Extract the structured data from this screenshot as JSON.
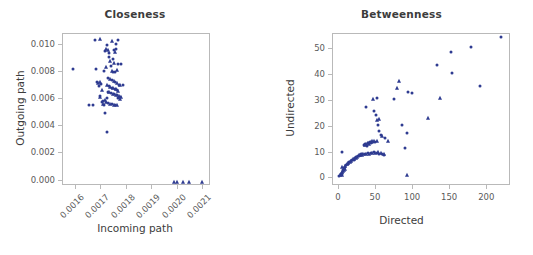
{
  "figure": {
    "background": "#ffffff",
    "marker_color": "#2e3b91",
    "axis_color": "#b9b9b9",
    "text_color": "#5a5a5a",
    "title_color": "#3c3c3c"
  },
  "chart_data": [
    {
      "type": "scatter",
      "title": "Closeness",
      "xlabel": "Incoming path",
      "ylabel": "Outgoing path",
      "xlim": [
        0.00155,
        0.00213
      ],
      "ylim": [
        -0.0004,
        0.0108
      ],
      "xticks": [
        0.0016,
        0.0017,
        0.0018,
        0.0019,
        0.002,
        0.0021
      ],
      "xticklabels": [
        "0.0016",
        "0.0017",
        "0.0018",
        "0.0019",
        "0.0020",
        "0.0021"
      ],
      "xtick_rotation": -45,
      "yticks": [
        0.0,
        0.002,
        0.004,
        0.006,
        0.008,
        0.01
      ],
      "yticklabels": [
        "0.000",
        "0.002",
        "0.004",
        "0.006",
        "0.008",
        "0.010"
      ],
      "grid": false,
      "legend": null,
      "points": [
        {
          "x": 0.001592,
          "y": 0.00818,
          "m": "dot"
        },
        {
          "x": 0.001655,
          "y": 0.00548,
          "m": "dot"
        },
        {
          "x": 0.001672,
          "y": 0.00548,
          "m": "dot"
        },
        {
          "x": 0.001679,
          "y": 0.01032,
          "m": "dot"
        },
        {
          "x": 0.0017,
          "y": 0.01035,
          "m": "tri"
        },
        {
          "x": 0.001682,
          "y": 0.00812,
          "m": "dot"
        },
        {
          "x": 0.001686,
          "y": 0.00718,
          "m": "dot"
        },
        {
          "x": 0.00169,
          "y": 0.00708,
          "m": "tri"
        },
        {
          "x": 0.001694,
          "y": 0.0069,
          "m": "dot"
        },
        {
          "x": 0.001697,
          "y": 0.00722,
          "m": "tri"
        },
        {
          "x": 0.001701,
          "y": 0.00702,
          "m": "dot"
        },
        {
          "x": 0.001705,
          "y": 0.0066,
          "m": "tri"
        },
        {
          "x": 0.001708,
          "y": 0.00568,
          "m": "dot"
        },
        {
          "x": 0.001712,
          "y": 0.00556,
          "m": "tri"
        },
        {
          "x": 0.001716,
          "y": 0.00548,
          "m": "dot"
        },
        {
          "x": 0.00172,
          "y": 0.00945,
          "m": "dot"
        },
        {
          "x": 0.001724,
          "y": 0.00965,
          "m": "tri"
        },
        {
          "x": 0.001727,
          "y": 0.00988,
          "m": "dot"
        },
        {
          "x": 0.00173,
          "y": 0.00958,
          "m": "tri"
        },
        {
          "x": 0.001733,
          "y": 0.0093,
          "m": "dot"
        },
        {
          "x": 0.001736,
          "y": 0.009,
          "m": "dot"
        },
        {
          "x": 0.001739,
          "y": 0.00875,
          "m": "tri"
        },
        {
          "x": 0.001742,
          "y": 0.00838,
          "m": "dot"
        },
        {
          "x": 0.001721,
          "y": 0.00828,
          "m": "tri"
        },
        {
          "x": 0.001745,
          "y": 0.0102,
          "m": "tri"
        },
        {
          "x": 0.00176,
          "y": 0.01,
          "m": "dot"
        },
        {
          "x": 0.001768,
          "y": 0.0103,
          "m": "dot"
        },
        {
          "x": 0.001752,
          "y": 0.00958,
          "m": "dot"
        },
        {
          "x": 0.001757,
          "y": 0.00938,
          "m": "tri"
        },
        {
          "x": 0.001762,
          "y": 0.0096,
          "m": "dot"
        },
        {
          "x": 0.001748,
          "y": 0.0089,
          "m": "dot"
        },
        {
          "x": 0.001755,
          "y": 0.00858,
          "m": "tri"
        },
        {
          "x": 0.001771,
          "y": 0.00855,
          "m": "dot"
        },
        {
          "x": 0.001744,
          "y": 0.008,
          "m": "tri"
        },
        {
          "x": 0.00175,
          "y": 0.00795,
          "m": "dot"
        },
        {
          "x": 0.001758,
          "y": 0.0079,
          "m": "dot"
        },
        {
          "x": 0.001764,
          "y": 0.0081,
          "m": "tri"
        },
        {
          "x": 0.001713,
          "y": 0.008,
          "m": "dot"
        },
        {
          "x": 0.001731,
          "y": 0.00752,
          "m": "dot"
        },
        {
          "x": 0.001738,
          "y": 0.00742,
          "m": "tri"
        },
        {
          "x": 0.001744,
          "y": 0.00735,
          "m": "dot"
        },
        {
          "x": 0.001752,
          "y": 0.00728,
          "m": "tri"
        },
        {
          "x": 0.001759,
          "y": 0.00722,
          "m": "dot"
        },
        {
          "x": 0.001766,
          "y": 0.00715,
          "m": "tri"
        },
        {
          "x": 0.001772,
          "y": 0.007,
          "m": "dot"
        },
        {
          "x": 0.001728,
          "y": 0.007,
          "m": "tri"
        },
        {
          "x": 0.001734,
          "y": 0.0069,
          "m": "dot"
        },
        {
          "x": 0.00174,
          "y": 0.00683,
          "m": "tri"
        },
        {
          "x": 0.001746,
          "y": 0.00678,
          "m": "dot"
        },
        {
          "x": 0.001751,
          "y": 0.00672,
          "m": "tri"
        },
        {
          "x": 0.001756,
          "y": 0.00668,
          "m": "dot"
        },
        {
          "x": 0.001761,
          "y": 0.00664,
          "m": "tri"
        },
        {
          "x": 0.001766,
          "y": 0.0066,
          "m": "dot"
        },
        {
          "x": 0.001771,
          "y": 0.00656,
          "m": "tri"
        },
        {
          "x": 0.001777,
          "y": 0.007,
          "m": "tri"
        },
        {
          "x": 0.00173,
          "y": 0.00648,
          "m": "dot"
        },
        {
          "x": 0.001736,
          "y": 0.00642,
          "m": "tri"
        },
        {
          "x": 0.001742,
          "y": 0.00638,
          "m": "dot"
        },
        {
          "x": 0.001748,
          "y": 0.00633,
          "m": "tri"
        },
        {
          "x": 0.001754,
          "y": 0.00628,
          "m": "dot"
        },
        {
          "x": 0.00176,
          "y": 0.00624,
          "m": "tri"
        },
        {
          "x": 0.001766,
          "y": 0.0062,
          "m": "dot"
        },
        {
          "x": 0.001772,
          "y": 0.00616,
          "m": "tri"
        },
        {
          "x": 0.001778,
          "y": 0.00612,
          "m": "dot"
        },
        {
          "x": 0.001783,
          "y": 0.00608,
          "m": "tri"
        },
        {
          "x": 0.001726,
          "y": 0.006,
          "m": "dot"
        },
        {
          "x": 0.001718,
          "y": 0.0059,
          "m": "tri"
        },
        {
          "x": 0.00171,
          "y": 0.00578,
          "m": "dot"
        },
        {
          "x": 0.001722,
          "y": 0.00572,
          "m": "tri"
        },
        {
          "x": 0.00173,
          "y": 0.00566,
          "m": "dot"
        },
        {
          "x": 0.001738,
          "y": 0.0056,
          "m": "tri"
        },
        {
          "x": 0.001745,
          "y": 0.00556,
          "m": "dot"
        },
        {
          "x": 0.001752,
          "y": 0.00552,
          "m": "tri"
        },
        {
          "x": 0.001758,
          "y": 0.00549,
          "m": "dot"
        },
        {
          "x": 0.001764,
          "y": 0.00546,
          "m": "tri"
        },
        {
          "x": 0.00177,
          "y": 0.006,
          "m": "dot"
        },
        {
          "x": 0.001776,
          "y": 0.00596,
          "m": "tri"
        },
        {
          "x": 0.001719,
          "y": 0.0049,
          "m": "dot"
        },
        {
          "x": 0.001728,
          "y": 0.00352,
          "m": "dot"
        },
        {
          "x": 0.001783,
          "y": 0.0085,
          "m": "dot"
        },
        {
          "x": 0.001788,
          "y": 0.007,
          "m": "dot"
        },
        {
          "x": 0.0017,
          "y": 0.0061,
          "m": "tri"
        },
        {
          "x": 0.001697,
          "y": 0.00618,
          "m": "dot"
        },
        {
          "x": 0.00199,
          "y": -0.00018,
          "m": "tri"
        },
        {
          "x": 0.002,
          "y": -0.00018,
          "m": "tri"
        },
        {
          "x": 0.002025,
          "y": -0.00018,
          "m": "tri"
        },
        {
          "x": 0.002048,
          "y": -0.00018,
          "m": "tri"
        },
        {
          "x": 0.002098,
          "y": -0.00018,
          "m": "tri"
        }
      ]
    },
    {
      "type": "scatter",
      "title": "Betweenness",
      "xlabel": "Directed",
      "ylabel": "Undirected",
      "xlim": [
        -8,
        232
      ],
      "ylim": [
        -3,
        56
      ],
      "xticks": [
        0,
        50,
        100,
        150,
        200
      ],
      "xticklabels": [
        "0",
        "50",
        "100",
        "150",
        "200"
      ],
      "xtick_rotation": 0,
      "yticks": [
        0,
        10,
        20,
        30,
        40,
        50
      ],
      "yticklabels": [
        "0",
        "10",
        "20",
        "30",
        "40",
        "50"
      ],
      "grid": false,
      "legend": null,
      "points": [
        {
          "x": 2,
          "y": 0.4,
          "m": "dot"
        },
        {
          "x": 3,
          "y": 0.8,
          "m": "tri"
        },
        {
          "x": 4,
          "y": 1.2,
          "m": "dot"
        },
        {
          "x": 5,
          "y": 1.0,
          "m": "tri"
        },
        {
          "x": 5,
          "y": 1.8,
          "m": "dot"
        },
        {
          "x": 6,
          "y": 2.0,
          "m": "tri"
        },
        {
          "x": 6,
          "y": 1.4,
          "m": "dot"
        },
        {
          "x": 7,
          "y": 2.4,
          "m": "tri"
        },
        {
          "x": 7,
          "y": 3.0,
          "m": "dot"
        },
        {
          "x": 8,
          "y": 2.8,
          "m": "tri"
        },
        {
          "x": 8,
          "y": 3.6,
          "m": "dot"
        },
        {
          "x": 9,
          "y": 3.2,
          "m": "tri"
        },
        {
          "x": 9,
          "y": 4.0,
          "m": "dot"
        },
        {
          "x": 10,
          "y": 4.4,
          "m": "tri"
        },
        {
          "x": 5,
          "y": 3.8,
          "m": "tri"
        },
        {
          "x": 5,
          "y": 9.8,
          "m": "dot"
        },
        {
          "x": 11,
          "y": 4.8,
          "m": "dot"
        },
        {
          "x": 12,
          "y": 5.2,
          "m": "tri"
        },
        {
          "x": 13,
          "y": 5.0,
          "m": "dot"
        },
        {
          "x": 14,
          "y": 5.6,
          "m": "tri"
        },
        {
          "x": 15,
          "y": 6.0,
          "m": "dot"
        },
        {
          "x": 16,
          "y": 5.8,
          "m": "tri"
        },
        {
          "x": 17,
          "y": 6.4,
          "m": "dot"
        },
        {
          "x": 18,
          "y": 6.2,
          "m": "tri"
        },
        {
          "x": 19,
          "y": 6.8,
          "m": "dot"
        },
        {
          "x": 20,
          "y": 7.0,
          "m": "tri"
        },
        {
          "x": 21,
          "y": 6.6,
          "m": "dot"
        },
        {
          "x": 22,
          "y": 7.2,
          "m": "tri"
        },
        {
          "x": 23,
          "y": 7.6,
          "m": "dot"
        },
        {
          "x": 24,
          "y": 7.4,
          "m": "tri"
        },
        {
          "x": 25,
          "y": 8.0,
          "m": "dot"
        },
        {
          "x": 26,
          "y": 7.8,
          "m": "tri"
        },
        {
          "x": 27,
          "y": 8.2,
          "m": "dot"
        },
        {
          "x": 28,
          "y": 8.6,
          "m": "tri"
        },
        {
          "x": 29,
          "y": 8.4,
          "m": "dot"
        },
        {
          "x": 30,
          "y": 8.8,
          "m": "tri"
        },
        {
          "x": 31,
          "y": 9.0,
          "m": "dot"
        },
        {
          "x": 32,
          "y": 8.6,
          "m": "tri"
        },
        {
          "x": 33,
          "y": 9.2,
          "m": "dot"
        },
        {
          "x": 34,
          "y": 8.9,
          "m": "tri"
        },
        {
          "x": 35,
          "y": 12.6,
          "m": "dot"
        },
        {
          "x": 36,
          "y": 12.4,
          "m": "tri"
        },
        {
          "x": 37,
          "y": 12.8,
          "m": "dot"
        },
        {
          "x": 38,
          "y": 13.0,
          "m": "tri"
        },
        {
          "x": 39,
          "y": 12.2,
          "m": "dot"
        },
        {
          "x": 40,
          "y": 13.2,
          "m": "tri"
        },
        {
          "x": 41,
          "y": 13.4,
          "m": "dot"
        },
        {
          "x": 42,
          "y": 13.0,
          "m": "tri"
        },
        {
          "x": 43,
          "y": 13.6,
          "m": "dot"
        },
        {
          "x": 44,
          "y": 13.8,
          "m": "tri"
        },
        {
          "x": 45,
          "y": 13.4,
          "m": "dot"
        },
        {
          "x": 46,
          "y": 14.0,
          "m": "tri"
        },
        {
          "x": 47,
          "y": 13.6,
          "m": "dot"
        },
        {
          "x": 48,
          "y": 14.2,
          "m": "tri"
        },
        {
          "x": 50,
          "y": 13.8,
          "m": "dot"
        },
        {
          "x": 52,
          "y": 14.0,
          "m": "tri"
        },
        {
          "x": 36,
          "y": 9.2,
          "m": "dot"
        },
        {
          "x": 38,
          "y": 9.0,
          "m": "tri"
        },
        {
          "x": 40,
          "y": 9.4,
          "m": "dot"
        },
        {
          "x": 42,
          "y": 9.2,
          "m": "tri"
        },
        {
          "x": 44,
          "y": 9.6,
          "m": "dot"
        },
        {
          "x": 46,
          "y": 9.4,
          "m": "tri"
        },
        {
          "x": 48,
          "y": 9.8,
          "m": "dot"
        },
        {
          "x": 50,
          "y": 9.6,
          "m": "tri"
        },
        {
          "x": 52,
          "y": 9.4,
          "m": "dot"
        },
        {
          "x": 54,
          "y": 9.8,
          "m": "tri"
        },
        {
          "x": 56,
          "y": 9.2,
          "m": "dot"
        },
        {
          "x": 58,
          "y": 9.6,
          "m": "tri"
        },
        {
          "x": 60,
          "y": 9.0,
          "m": "dot"
        },
        {
          "x": 62,
          "y": 9.2,
          "m": "tri"
        },
        {
          "x": 62,
          "y": 8.6,
          "m": "dot"
        },
        {
          "x": 38,
          "y": 27.4,
          "m": "dot"
        },
        {
          "x": 47,
          "y": 30.2,
          "m": "tri"
        },
        {
          "x": 52,
          "y": 30.6,
          "m": "dot"
        },
        {
          "x": 49,
          "y": 25.8,
          "m": "dot"
        },
        {
          "x": 51,
          "y": 24.0,
          "m": "dot"
        },
        {
          "x": 53,
          "y": 22.4,
          "m": "tri"
        },
        {
          "x": 54,
          "y": 20.2,
          "m": "dot"
        },
        {
          "x": 55,
          "y": 18.0,
          "m": "dot"
        },
        {
          "x": 56,
          "y": 22.6,
          "m": "tri"
        },
        {
          "x": 58,
          "y": 16.6,
          "m": "dot"
        },
        {
          "x": 60,
          "y": 16.2,
          "m": "tri"
        },
        {
          "x": 63,
          "y": 15.4,
          "m": "dot"
        },
        {
          "x": 67,
          "y": 14.0,
          "m": "tri"
        },
        {
          "x": 76,
          "y": 30.2,
          "m": "dot"
        },
        {
          "x": 79,
          "y": 34.6,
          "m": "tri"
        },
        {
          "x": 83,
          "y": 37.4,
          "m": "tri"
        },
        {
          "x": 86,
          "y": 20.4,
          "m": "dot"
        },
        {
          "x": 90,
          "y": 11.4,
          "m": "dot"
        },
        {
          "x": 93,
          "y": 17.2,
          "m": "dot"
        },
        {
          "x": 93,
          "y": 1.0,
          "m": "tri"
        },
        {
          "x": 95,
          "y": 33.2,
          "m": "dot"
        },
        {
          "x": 100,
          "y": 32.6,
          "m": "dot"
        },
        {
          "x": 121,
          "y": 23.2,
          "m": "tri"
        },
        {
          "x": 134,
          "y": 43.4,
          "m": "dot"
        },
        {
          "x": 138,
          "y": 30.8,
          "m": "tri"
        },
        {
          "x": 152,
          "y": 48.6,
          "m": "dot"
        },
        {
          "x": 154,
          "y": 40.4,
          "m": "dot"
        },
        {
          "x": 180,
          "y": 50.6,
          "m": "dot"
        },
        {
          "x": 192,
          "y": 35.6,
          "m": "dot"
        },
        {
          "x": 220,
          "y": 54.4,
          "m": "dot"
        }
      ]
    }
  ]
}
